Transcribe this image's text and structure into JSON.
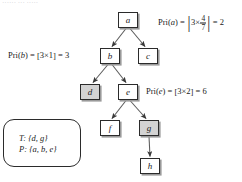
{
  "figure": {
    "type": "tree-diagram",
    "background_color": "#ffffff",
    "node_border_color": "#2b2b2b",
    "node_fill_color": "#ffffff",
    "node_shaded_fill_color": "#d3d3d3",
    "edge_color": "#4a4a4a",
    "text_color": "#1b1b1b",
    "top_cropped_text": "······ ··· ·····"
  },
  "nodes": [
    {
      "id": "a",
      "label": "a",
      "x": 118,
      "y": 12,
      "shaded": false
    },
    {
      "id": "b",
      "label": "b",
      "x": 100,
      "y": 48,
      "shaded": false
    },
    {
      "id": "c",
      "label": "c",
      "x": 138,
      "y": 48,
      "shaded": false
    },
    {
      "id": "d",
      "label": "d",
      "x": 80,
      "y": 84,
      "shaded": true
    },
    {
      "id": "e",
      "label": "e",
      "x": 118,
      "y": 84,
      "shaded": false
    },
    {
      "id": "f",
      "label": "f",
      "x": 100,
      "y": 120,
      "shaded": false
    },
    {
      "id": "g",
      "label": "g",
      "x": 139,
      "y": 120,
      "shaded": true
    },
    {
      "id": "h",
      "label": "h",
      "x": 140,
      "y": 158,
      "shaded": false
    }
  ],
  "edges": [
    {
      "from": "a",
      "to": "b"
    },
    {
      "from": "a",
      "to": "c"
    },
    {
      "from": "b",
      "to": "d"
    },
    {
      "from": "b",
      "to": "e"
    },
    {
      "from": "e",
      "to": "f"
    },
    {
      "from": "e",
      "to": "g"
    },
    {
      "from": "g",
      "to": "h"
    }
  ],
  "formulas": {
    "pri_a": {
      "function_name": "Pri",
      "argument": "a",
      "prefix": "Pri(",
      "suffix": ") = ",
      "bracket_type": "absolute-value",
      "factor": "3",
      "times": "×",
      "numerator": "4",
      "denominator": "7",
      "equals": " = ",
      "result": "2"
    },
    "pri_b": {
      "function_name": "Pri",
      "argument": "b",
      "prefix": "Pri(",
      "suffix": ") = ",
      "bracket_open": "[",
      "bracket_close": "]",
      "expression": "3×1",
      "equals": " = ",
      "result": "3"
    },
    "pri_e": {
      "function_name": "Pri",
      "argument": "e",
      "prefix": "Pri(",
      "suffix": ") = ",
      "bracket_open": "[",
      "bracket_close": "]",
      "expression": "3×2",
      "equals": " = ",
      "result": "6"
    }
  },
  "sets_box": {
    "line_t": "T: {d, g}",
    "line_p": "P: {a, b, e}"
  }
}
